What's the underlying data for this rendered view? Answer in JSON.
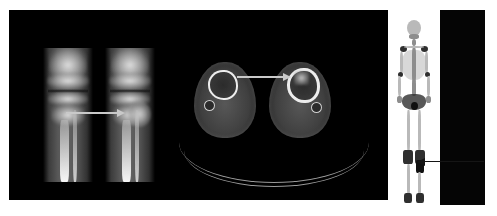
{
  "figure": {
    "background_color": "#ffffff",
    "width": 497,
    "height": 216
  },
  "panels": [
    {
      "id": "ct-panel",
      "name": "ct-panel",
      "modality": "CT",
      "background_color": "#000000",
      "bounds": {
        "x": 9,
        "y": 10,
        "w": 379,
        "h": 190
      }
    },
    {
      "id": "scan-panel",
      "name": "bone-scan-panel",
      "modality": "Bone scintigraphy",
      "background_color": "#ffffff",
      "bounds": {
        "x": 388,
        "y": 10,
        "w": 52,
        "h": 196
      }
    },
    {
      "id": "blackout-panel",
      "name": "blackout-panel",
      "modality": "Masked region",
      "background_color": "#050505",
      "bounds": {
        "x": 440,
        "y": 10,
        "w": 45,
        "h": 195
      }
    }
  ],
  "views": {
    "coronal": {
      "label": "Coronal CT of both knees and proximal tibiae",
      "left_image_label": "Right knee (normal)",
      "right_image_label": "Left knee (lesion)"
    },
    "axial": {
      "label": "Axial CT through both lower legs",
      "left_image_label": "Right leg cross-section",
      "right_image_label": "Left leg cross-section"
    },
    "scintigraphy": {
      "label": "Anterior whole-body bone scan",
      "finding_label": "Focal intense uptake, left proximal tibia"
    }
  },
  "annotations": [
    {
      "name": "coronal-arrow",
      "type": "arrow",
      "direction": "right",
      "color": "#c9c9c9",
      "points_to": "Left proximal tibial lesion on coronal CT"
    },
    {
      "name": "axial-arrow",
      "type": "arrow",
      "direction": "right",
      "color": "#c9c9c9",
      "points_to": "Cortical lesion of left tibia on axial CT"
    },
    {
      "name": "scan-arrow",
      "type": "arrow",
      "direction": "left",
      "color": "#151515",
      "points_to": "Hot spot in left proximal tibia on bone scan"
    }
  ],
  "colors": {
    "panel_black": "#000000",
    "panel_white": "#ffffff",
    "arrow_light": "#c9c9c9",
    "arrow_dark": "#151515",
    "bone_bright": "#fafafa",
    "soft_tissue": "#5e5e5e"
  }
}
